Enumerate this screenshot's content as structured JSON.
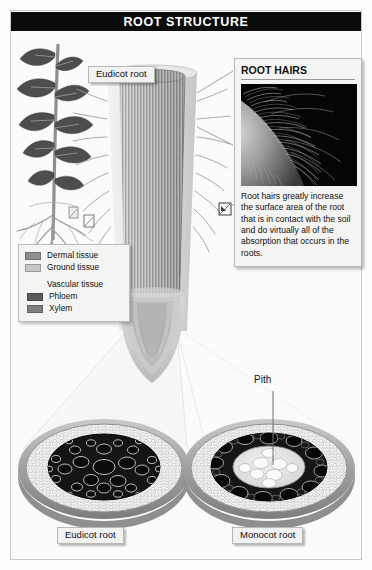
{
  "header": {
    "title": "ROOT STRUCTURE"
  },
  "labels": {
    "eudicot_root_top": "Eudicot root",
    "eudicot_root_bottom": "Eudicot root",
    "monocot_root_bottom": "Monocot root",
    "pith": "Pith"
  },
  "legend": {
    "items": [
      {
        "label": "Dermal tissue",
        "color": "#8d8d8d",
        "type": "swatch"
      },
      {
        "label": "Ground tissue",
        "color": "#c6c6c6",
        "type": "swatch"
      },
      {
        "label": "Vascular tissue",
        "color": null,
        "type": "header"
      },
      {
        "label": "Phloem",
        "color": "#5a5a5a",
        "type": "swatch"
      },
      {
        "label": "Xylem",
        "color": "#7e7e7e",
        "type": "swatch"
      }
    ]
  },
  "root_hairs_panel": {
    "title": "ROOT HAIRS",
    "caption": "Root hairs greatly increase the surface area of the root that is in contact with the soil and do virtually all of the absorption that occurs in the roots.",
    "photo_description": "micrograph-root-hairs"
  },
  "colors": {
    "title_bar_bg": "#0b0b0b",
    "title_bar_text": "#ffffff",
    "page_bg": "#fbfbfb",
    "panel_bg": "#f4f4f2",
    "panel_border": "#b9b9b7",
    "dermal": "#8d8d8d",
    "ground": "#c6c6c6",
    "phloem": "#5a5a5a",
    "xylem": "#7e7e7e",
    "stele_dark": "#111111",
    "leaf_dark": "#4a4a4a",
    "leader_line": "#8a8a8a"
  },
  "diagram": {
    "type": "labeled-biology-diagram",
    "elements": [
      "whole-plant-illustration",
      "eudicot-root-cylinder-cutaway",
      "root-tip",
      "eudicot-cross-section",
      "monocot-cross-section",
      "root-hairs-micrograph"
    ],
    "eudicot_cross_section": {
      "name": "Eudicot root cross section",
      "regions": [
        "epidermis",
        "cortex",
        "central stele with xylem and phloem"
      ],
      "stele_arrangement": "solid central mass of large dark vascular cells"
    },
    "monocot_cross_section": {
      "name": "Monocot root cross section",
      "regions": [
        "epidermis",
        "cortex",
        "ring of vascular bundles",
        "central pith"
      ],
      "stele_arrangement": "ring of discrete dark vascular bundles surrounding a light pith"
    }
  }
}
